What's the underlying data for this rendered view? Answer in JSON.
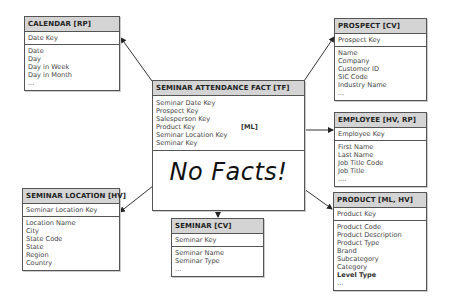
{
  "fact": {
    "title": "SEMINAR ATTENDANCE FACT [TF]",
    "keys": [
      "Seminar Date Key",
      "Prospect Key",
      "Salesperson Key",
      "Product Key",
      "Seminar Location Key",
      "Seminar Key"
    ],
    "product_key_tag": "[ML]",
    "note": "No Facts!"
  },
  "calendar": {
    "title": "CALENDAR [RP]",
    "key": "Date Key",
    "attributes": [
      "Date",
      "Day",
      "Day in Week",
      "Day in Month",
      "..."
    ]
  },
  "prospect": {
    "title": "PROSPECT [CV]",
    "key": "Prospect Key",
    "attributes": [
      "Name",
      "Company",
      "Customer ID",
      "SIC Code",
      "Industry Name",
      "..."
    ]
  },
  "employee": {
    "title": "EMPLOYEE [HV, RP]",
    "key": "Employee Key",
    "attributes": [
      "First Name",
      "Last Name",
      "Job Title Code",
      "Job Title",
      "...."
    ]
  },
  "product": {
    "title": "PRODUCT [ML, HV]",
    "key": "Product Key",
    "attributes": [
      "Product Code",
      "Product Description",
      "Product Type",
      "Brand",
      "Subcategory",
      "Category"
    ],
    "bold_attribute": "Level Type",
    "ellipsis": "..."
  },
  "seminar_location": {
    "title": "SEMINAR LOCATION [HV]",
    "key": "Seminar Location Key",
    "attributes": [
      "Location Name",
      "City",
      "State Code",
      "State",
      "Region",
      "Country"
    ]
  },
  "seminar": {
    "title": "SEMINAR [CV]",
    "key": "Seminar Key",
    "attributes": [
      "Seminar Name",
      "Seminar Type",
      "..."
    ]
  }
}
